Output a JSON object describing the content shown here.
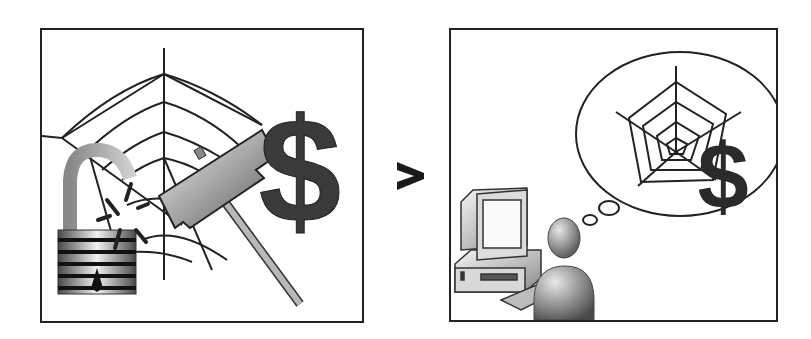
{
  "diagram": {
    "comparison_symbol": ">",
    "left_panel": {
      "elements": [
        "spider-web-icon",
        "broken-padlock-icon",
        "hammer-icon",
        "dollar-sign-icon"
      ],
      "colors": {
        "stroke": "#222222",
        "dollar": "#3a3a3a",
        "metal_light": "#e6e6e6",
        "metal_dark": "#5a5a5a"
      }
    },
    "right_panel": {
      "elements": [
        "computer-icon",
        "person-icon",
        "thought-bubble",
        "spider-web-icon",
        "dollar-sign-icon"
      ],
      "colors": {
        "stroke": "#222222",
        "dollar": "#2a2a2a",
        "person": "#6e6e6e"
      }
    }
  }
}
